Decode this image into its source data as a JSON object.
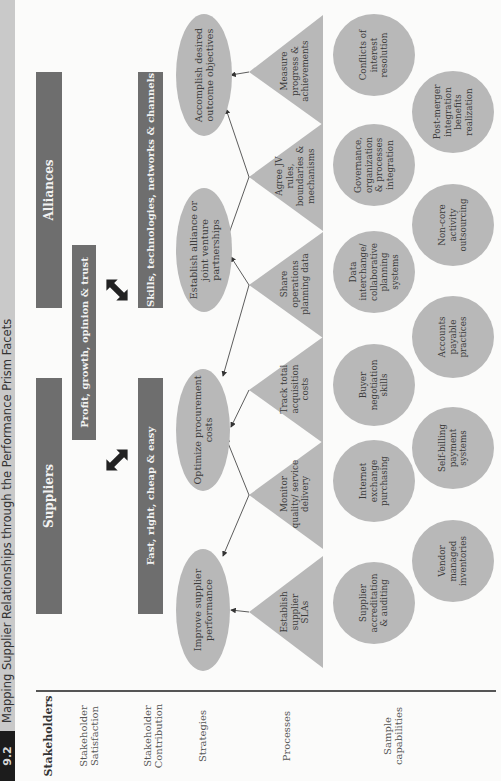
{
  "caption": {
    "number": "9.2",
    "title": "Mapping Supplier Relationships through the Performance Prism Facets"
  },
  "row_labels": {
    "stakeholders": "Stakeholders",
    "satisfaction": "Stakeholder Satisfaction",
    "contribution": "Stakeholder Contribution",
    "strategies": "Strategies",
    "processes": "Processes",
    "capabilities": "Sample capabilities"
  },
  "stakeholders": {
    "suppliers": "Suppliers",
    "alliances": "Alliances"
  },
  "satisfaction": {
    "shared": "Profit, growth, opinion & trust"
  },
  "contribution": {
    "suppliers": "Fast, right, cheap & easy",
    "alliances": "Skills, technologies, networks & channels"
  },
  "strategies": [
    "Improve supplier performance",
    "Optimize procurement costs",
    "Establish alliance or joint venture partnerships",
    "Accomplish desired outcome objectives"
  ],
  "processes": [
    "Establish supplier SLAs",
    "Monitor quality/ service delivery",
    "Track total acquisition costs",
    "Share operations planning data",
    "Agree JV rules, boundaries & mechanisms",
    "Measure progress & achievements"
  ],
  "capabilities": {
    "row1": [
      "Supplier accreditation & auditing",
      "Internet exchange purchasing",
      "Buyer negotiation skills",
      "Data interchange/ collaborative planning systems",
      "Governance, organization & processes integration",
      "Conflicts of interest resolution"
    ],
    "row2": [
      "Vendor managed inventories",
      "Self-billing payment systems",
      "Accounts payable practices",
      "Non-core activity outsourcing",
      "Post-merger integration benefits realization"
    ]
  },
  "colors": {
    "bar": "#6e6e6e",
    "shape_fill": "#b8b8b8",
    "caption_strip": "#c9c9c9",
    "caption_number_bg": "#1c1c1c",
    "arrow": "#222222"
  }
}
